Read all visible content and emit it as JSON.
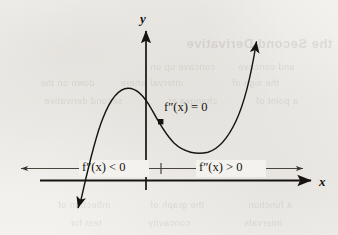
{
  "figure": {
    "kind": "calculus-concavity-diagram",
    "background_color": "#f4f2ef",
    "ink_color": "#14120f"
  },
  "axes": {
    "y_axis_label": "y",
    "x_axis_label": "x",
    "y_axis_name": "y-axis",
    "x_axis_name": "x-axis"
  },
  "annotations": {
    "inflection_label": "f″(x) = 0",
    "concave_down_label": "f″(x) < 0",
    "concave_up_label": "f″(x) > 0",
    "inflection_point_marker": "filled-square"
  },
  "ghost_text": {
    "lines": [
      {
        "text": "the Second Derivative",
        "left": 186,
        "top": 36,
        "size": 13,
        "weight": "700"
      },
      {
        "text": "concave up on",
        "left": 150,
        "top": 62,
        "size": 9,
        "weight": "400"
      },
      {
        "text": "and concave",
        "left": 238,
        "top": 62,
        "size": 9,
        "weight": "400"
      },
      {
        "text": "down on the",
        "left": 40,
        "top": 78,
        "size": 9,
        "weight": "400"
      },
      {
        "text": "interval where",
        "left": 120,
        "top": 78,
        "size": 9,
        "weight": "400"
      },
      {
        "text": "the sign of",
        "left": 232,
        "top": 78,
        "size": 9,
        "weight": "400"
      },
      {
        "text": "second derivative",
        "left": 44,
        "top": 96,
        "size": 9,
        "weight": "400"
      },
      {
        "text": "changes at",
        "left": 168,
        "top": 96,
        "size": 9,
        "weight": "400"
      },
      {
        "text": "a point of",
        "left": 256,
        "top": 96,
        "size": 9,
        "weight": "400"
      },
      {
        "text": "inflection of",
        "left": 58,
        "top": 200,
        "size": 9,
        "weight": "400"
      },
      {
        "text": "the graph of",
        "left": 150,
        "top": 200,
        "size": 9,
        "weight": "400"
      },
      {
        "text": "a function",
        "left": 248,
        "top": 200,
        "size": 9,
        "weight": "400"
      },
      {
        "text": "test for",
        "left": 70,
        "top": 218,
        "size": 9,
        "weight": "400"
      },
      {
        "text": "concavity",
        "left": 148,
        "top": 218,
        "size": 9,
        "weight": "400"
      },
      {
        "text": "intervals",
        "left": 244,
        "top": 218,
        "size": 9,
        "weight": "400"
      }
    ]
  },
  "chart_data": {
    "type": "line",
    "title": "",
    "xlabel": "x",
    "ylabel": "y",
    "grid": false,
    "legend": null,
    "origin_px": {
      "x": 146,
      "y": 180
    },
    "curve_description": "Cubic curve: rises from lower-left arrow, local maximum, descends through inflection point, local minimum, rises to upper-right arrow",
    "features": [
      {
        "name": "local-maximum",
        "px": {
          "x": 128,
          "y": 88
        }
      },
      {
        "name": "inflection-point",
        "px": {
          "x": 161,
          "y": 122
        },
        "label": "f″(x) = 0"
      },
      {
        "name": "local-minimum",
        "px": {
          "x": 208,
          "y": 152
        }
      },
      {
        "name": "start-arrow",
        "px": {
          "x": 78,
          "y": 208
        },
        "direction": "down-left"
      },
      {
        "name": "end-arrow",
        "px": {
          "x": 258,
          "y": 36
        },
        "direction": "up-right"
      }
    ],
    "number_line": {
      "y_px": 168,
      "x_start_px": 20,
      "x_end_px": 306,
      "tick_px": 161,
      "left_region": {
        "label": "f″(x) < 0",
        "meaning": "concave down"
      },
      "right_region": {
        "label": "f″(x) > 0",
        "meaning": "concave up"
      }
    }
  }
}
